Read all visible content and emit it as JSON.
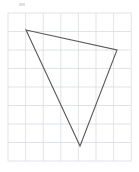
{
  "figure": {
    "name": "triangle-on-grid",
    "canvas": {
      "width": 139,
      "height": 172,
      "background": "#ffffff"
    },
    "grid": {
      "label": "square grid",
      "x0": 8,
      "y0": 13,
      "columns": 7,
      "rows": 8,
      "cell_width": 17.6,
      "cell_height": 18.5,
      "line_color": "#d8dce3",
      "line_width": 0.8,
      "border_color": "#d8dce3"
    },
    "shape": {
      "label": "triangle",
      "type": "polygon",
      "stroke_color": "#5a5a5a",
      "stroke_width": 1.1,
      "fill": "none",
      "vertices": [
        {
          "name": "top-left-vertex",
          "x": 26,
          "y": 30
        },
        {
          "name": "right-vertex",
          "x": 117,
          "y": 50
        },
        {
          "name": "bottom-vertex",
          "x": 80,
          "y": 146
        }
      ]
    },
    "artifact": {
      "name": "top-speck",
      "x": 19,
      "y": 3,
      "width": 6,
      "height": 3,
      "color": "#e2e2e2"
    }
  }
}
